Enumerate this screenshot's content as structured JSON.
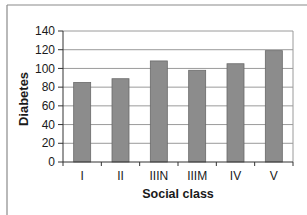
{
  "chart_data": {
    "type": "bar",
    "title": "",
    "xlabel": "Social class",
    "ylabel": "Diabetes",
    "categories": [
      "I",
      "II",
      "IIIN",
      "IIIM",
      "IV",
      "V"
    ],
    "values": [
      85,
      89,
      108,
      98,
      105,
      119
    ],
    "ylim": [
      0,
      140
    ],
    "yticks": [
      0,
      20,
      40,
      60,
      80,
      100,
      120,
      140
    ],
    "grid": true,
    "legend": null
  },
  "colors": {
    "bar_fill": "#8c8c8c",
    "bar_edge": "#6a6a6a",
    "gridline": "#9a9a9a",
    "axis": "#333333",
    "frame": "#8a8a8a"
  }
}
